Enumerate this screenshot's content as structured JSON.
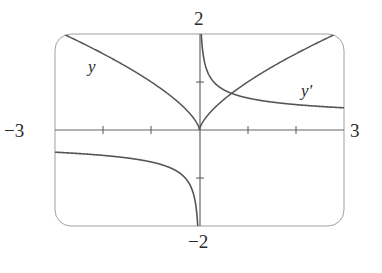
{
  "chart_data": {
    "type": "line",
    "title": "",
    "xlabel": "",
    "ylabel": "",
    "xlim": [
      -3,
      3
    ],
    "ylim": [
      -2,
      2
    ],
    "grid": false,
    "axis_tick_labels": {
      "x_min": "−3",
      "x_max": "3",
      "y_max": "2",
      "y_min": "−2"
    },
    "x_ticks": [
      -2,
      -1,
      1,
      2
    ],
    "y_ticks": [
      -1,
      1
    ],
    "series": [
      {
        "name": "y",
        "label": "y",
        "formula": "y = x^(2/3)",
        "x": [
          -3,
          -2,
          -1,
          -0.5,
          0,
          0.5,
          1,
          2,
          3
        ],
        "values": [
          2.08,
          1.59,
          1.0,
          0.63,
          0,
          0.63,
          1.0,
          1.59,
          2.08
        ]
      },
      {
        "name": "y'",
        "label": "y′",
        "formula": "y' = (2/3) x^(-1/3)",
        "x": [
          -3,
          -2,
          -1,
          -0.5,
          -0.1,
          0.1,
          0.5,
          1,
          2,
          3
        ],
        "values": [
          -0.46,
          -0.53,
          -0.67,
          -0.84,
          -1.44,
          1.44,
          0.84,
          0.67,
          0.53,
          0.46
        ]
      }
    ],
    "annotations": [
      {
        "text": "y",
        "near": "left branch of y curve"
      },
      {
        "text": "y′",
        "near": "right branch of y' curve"
      }
    ]
  },
  "labels": {
    "x_min": "−3",
    "x_max": "3",
    "y_max": "2",
    "y_min": "−2",
    "curve_y": "y",
    "curve_yprime": "y′"
  },
  "colors": {
    "curve": "#555555",
    "axis": "#666666",
    "frame": "#999999",
    "text": "#2a2a2a"
  }
}
